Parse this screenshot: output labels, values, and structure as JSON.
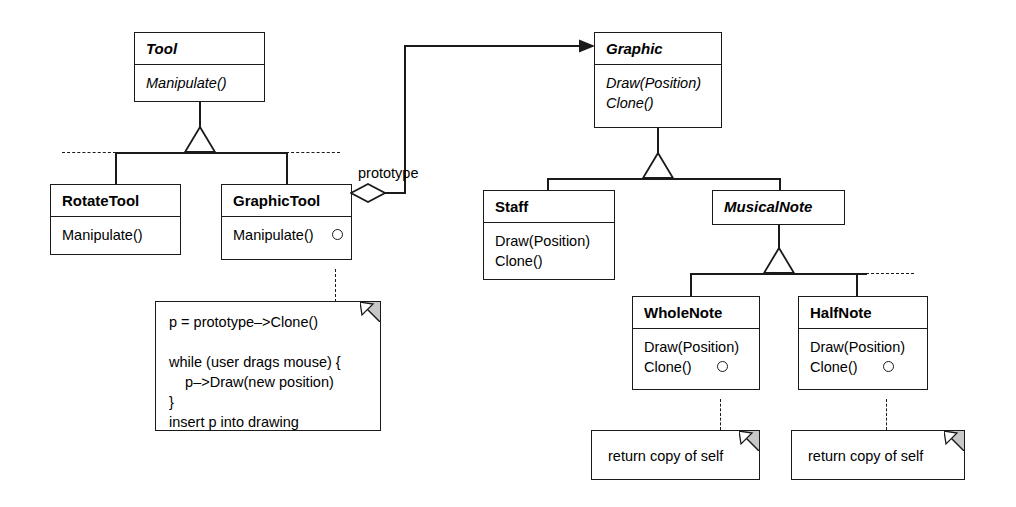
{
  "diagram": {
    "kind": "uml-class-diagram",
    "pattern": "Prototype",
    "stroke_color": "#1a1a1a",
    "fold_fill": "#c8c8c8",
    "background": "#ffffff"
  },
  "classes": {
    "tool": {
      "name": "Tool",
      "abstract": true,
      "operations": [
        "Manipulate()"
      ]
    },
    "rotate_tool": {
      "name": "RotateTool",
      "abstract": false,
      "operations": [
        "Manipulate()"
      ]
    },
    "graphic_tool": {
      "name": "GraphicTool",
      "abstract": false,
      "operations": [
        "Manipulate()"
      ]
    },
    "graphic": {
      "name": "Graphic",
      "abstract": true,
      "operations": [
        "Draw(Position)",
        "Clone()"
      ]
    },
    "staff": {
      "name": "Staff",
      "abstract": false,
      "operations": [
        "Draw(Position)",
        "Clone()"
      ]
    },
    "musical_note": {
      "name": "MusicalNote",
      "abstract": true,
      "operations": []
    },
    "whole_note": {
      "name": "WholeNote",
      "abstract": false,
      "operations": [
        "Draw(Position)",
        "Clone()"
      ]
    },
    "half_note": {
      "name": "HalfNote",
      "abstract": false,
      "operations": [
        "Draw(Position)",
        "Clone()"
      ]
    }
  },
  "relations": {
    "prototype_label": "prototype"
  },
  "notes": {
    "graphic_tool_code": "p = prototype–>Clone()\n\nwhile (user drags mouse) {\n    p–>Draw(new position)\n}\ninsert p into drawing",
    "whole_note_clone": "return copy of self",
    "half_note_clone": "return copy of self"
  }
}
